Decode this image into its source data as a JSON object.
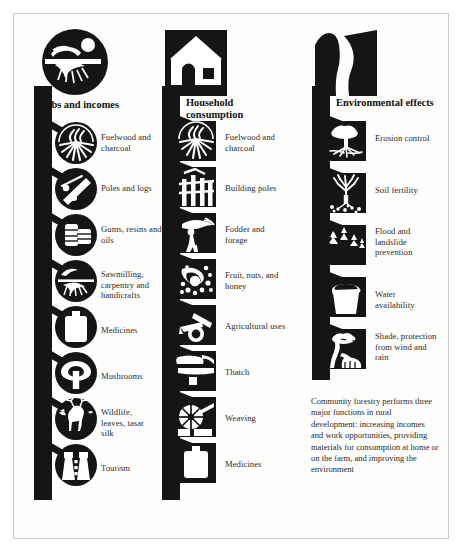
{
  "figure": {
    "title_hidden": "",
    "background_color": "#ffffff",
    "ink_color": "#151515",
    "border_color": "#c9c9c9"
  },
  "columns": [
    {
      "id": "jobs-and-incomes",
      "heading": "Jobs and incomes",
      "header_icon": "sawmill-worker-icon",
      "icon_shape": "circle",
      "items": [
        {
          "label": "Fuelwood and charcoal",
          "icon": "fuelwood-fire-icon"
        },
        {
          "label": "Poles and logs",
          "icon": "poles-and-logs-icon"
        },
        {
          "label": "Gums, resins and oils",
          "icon": "resin-barrels-icon"
        },
        {
          "label": "Sawmilling, carpentry and handicrafts",
          "icon": "sawblade-icon"
        },
        {
          "label": "Medicines",
          "icon": "medicine-bottle-icon"
        },
        {
          "label": "Mushrooms",
          "icon": "mushroom-icon"
        },
        {
          "label": "Wildlife, leaves, tasar silk",
          "icon": "deer-wildlife-icon"
        },
        {
          "label": "Tourism",
          "icon": "binoculars-tourism-icon"
        }
      ]
    },
    {
      "id": "household-consumption",
      "heading": "Household consumption",
      "header_icon": "house-icon",
      "icon_shape": "square",
      "items": [
        {
          "label": "Fuelwood and charcoal",
          "icon": "fuelwood-fire-icon"
        },
        {
          "label": "Building poles",
          "icon": "building-poles-icon"
        },
        {
          "label": "Fodder and forage",
          "icon": "fodder-carrier-icon"
        },
        {
          "label": "Fruit, nuts, and honey",
          "icon": "fruit-nuts-honey-icon"
        },
        {
          "label": "Agricultural uses",
          "icon": "plough-icon"
        },
        {
          "label": "Thatch",
          "icon": "thatch-roof-icon"
        },
        {
          "label": "Weaving",
          "icon": "spinning-wheel-icon"
        },
        {
          "label": "Medicines",
          "icon": "medicine-bottle-icon"
        }
      ]
    },
    {
      "id": "environmental-effects",
      "heading": "Environmental effects",
      "header_icon": "hillside-stream-icon",
      "icon_shape": "square",
      "items": [
        {
          "label": "Erosion control",
          "icon": "tree-roots-icon"
        },
        {
          "label": "Soil fertility",
          "icon": "tree-soil-icon"
        },
        {
          "label": "Flood and landslide prevention",
          "icon": "conifer-stand-icon"
        },
        {
          "label": "Water availability",
          "icon": "water-bucket-icon"
        },
        {
          "label": "Shade, protection from wind and rain",
          "icon": "shade-tree-cattle-icon"
        }
      ]
    }
  ],
  "caption": {
    "text": "Community forestry performs three major functions in rural development: increasing incomes and work opportunities, providing materials for consumption at home or on the farm, and improving the environment"
  }
}
